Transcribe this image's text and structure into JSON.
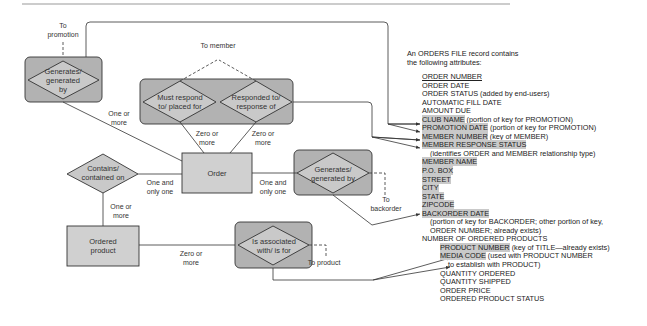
{
  "colors": {
    "entity_fill": "#d0d0d0",
    "group_fill": "#b2b2b2",
    "diamond_fill": "#c9c9c9",
    "highlight": "#c9c9c9",
    "line": "#333333"
  },
  "entities": {
    "order": "Order",
    "ordered_product": "Ordered product"
  },
  "relationships": {
    "promotion": "Generates/ generated by",
    "member_must": "Must respond to/ placed for",
    "member_responded": "Responded to/ response of",
    "backorder": "Generates/ generated by",
    "contains": "Contains/ contained on",
    "associated": "Is associated with/ is for"
  },
  "references": {
    "to_promotion": "To promotion",
    "to_member": "To member",
    "to_backorder": "To backorder",
    "to_product": "To product"
  },
  "cardinalities": {
    "promotion_order": "One or more",
    "must_order": "Zero or more",
    "responded_order": "Zero or more",
    "order_contains": "One and only one",
    "order_backorder": "One and only one",
    "contains_product": "One or more",
    "product_associated": "Zero or more"
  },
  "intro": {
    "line1": "An ORDERS FILE record contains",
    "line2": "the following attributes:"
  },
  "attributes": [
    {
      "text": "ORDER NUMBER",
      "note": "",
      "style": "underline",
      "indent": 0
    },
    {
      "text": "ORDER DATE",
      "note": "",
      "style": "",
      "indent": 0
    },
    {
      "text": "ORDER STATUS",
      "note": " (added by end-users)",
      "style": "",
      "indent": 0
    },
    {
      "text": "AUTOMATIC FILL DATE",
      "note": "",
      "style": "",
      "indent": 0
    },
    {
      "text": "AMOUNT DUE",
      "note": "",
      "style": "",
      "indent": 0
    },
    {
      "text": "CLUB NAME",
      "note": " (portion of key for PROMOTION)",
      "style": "highlight",
      "indent": 0
    },
    {
      "text": "PROMOTION DATE",
      "note": " (portion of key for PROMOTION)",
      "style": "highlight",
      "indent": 0
    },
    {
      "text": "MEMBER NUMBER",
      "note": " (key of MEMBER)",
      "style": "highlight",
      "indent": 0
    },
    {
      "text": "MEMBER RESPONSE STATUS",
      "note": "",
      "style": "highlight",
      "indent": 0
    },
    {
      "text": "",
      "note": "(identifies ORDER and MEMBER  relationship type)",
      "style": "",
      "indent": 8
    },
    {
      "text": "MEMBER NAME",
      "note": "",
      "style": "highlight",
      "indent": 0
    },
    {
      "text": "P.O. BOX",
      "note": "",
      "style": "highlight",
      "indent": 0
    },
    {
      "text": "STREET",
      "note": "",
      "style": "highlight",
      "indent": 0
    },
    {
      "text": "CITY",
      "note": "",
      "style": "highlight",
      "indent": 0
    },
    {
      "text": "STATE",
      "note": "",
      "style": "highlight",
      "indent": 0
    },
    {
      "text": "ZIPCODE",
      "note": "",
      "style": "highlight",
      "indent": 0
    },
    {
      "text": "BACKORDER DATE",
      "note": "",
      "style": "highlight",
      "indent": 0
    },
    {
      "text": "",
      "note": "(portion of key for BACKORDER; other portion of key,",
      "style": "",
      "indent": 8
    },
    {
      "text": "",
      "note": "ORDER NUMBER; already exists)",
      "style": "",
      "indent": 8
    },
    {
      "text": "NUMBER OF ORDERED PRODUCTS",
      "note": "",
      "style": "",
      "indent": 0
    },
    {
      "text": "PRODUCT NUMBER",
      "note": " (key of TITLE—already exists)",
      "style": "highlight",
      "indent": 18
    },
    {
      "text": "MEDIA CODE",
      "note": " (used with PRODUCT NUMBER",
      "style": "highlight",
      "indent": 18
    },
    {
      "text": "",
      "note": "to establish with PRODUCT)",
      "style": "",
      "indent": 26
    },
    {
      "text": "QUANTITY ORDERED",
      "note": "",
      "style": "",
      "indent": 18
    },
    {
      "text": "QUANTITY SHIPPED",
      "note": "",
      "style": "",
      "indent": 18
    },
    {
      "text": "ORDER PRICE",
      "note": "",
      "style": "",
      "indent": 18
    },
    {
      "text": "ORDERED PRODUCT STATUS",
      "note": "",
      "style": "",
      "indent": 18
    }
  ]
}
